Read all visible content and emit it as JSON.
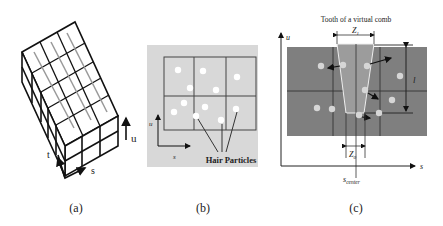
{
  "panels": {
    "a": {
      "caption": "(a)",
      "axes": {
        "u": "u",
        "t": "t",
        "s": "s"
      }
    },
    "b": {
      "caption": "(b)",
      "axes": {
        "u": "u",
        "s": "s"
      },
      "annotation": "Hair Particles",
      "background": "#d8d8d8"
    },
    "c": {
      "caption": "(c)",
      "title": "Tooth of a virtual comb",
      "axes": {
        "u": "u",
        "s": "s"
      },
      "labels": {
        "z1": "Z",
        "z1_sub": "1",
        "z0": "Z",
        "z0_sub": "0",
        "l": "l",
        "s_center": "s",
        "s_center_sub": "center"
      },
      "background": "#808080",
      "tooth_color": "#9a9a9a"
    }
  }
}
